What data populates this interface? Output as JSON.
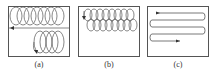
{
  "figure": {
    "panels": [
      {
        "id": "a",
        "caption": "(a)",
        "pattern": "spiral-loops-two-rows"
      },
      {
        "id": "b",
        "caption": "(b)",
        "pattern": "dense-spiral-loops"
      },
      {
        "id": "c",
        "caption": "(c)",
        "pattern": "boustrophedon-zigzag"
      }
    ],
    "colors": {
      "stroke": "#444444",
      "frame": "#555555",
      "background": "#ffffff"
    }
  }
}
